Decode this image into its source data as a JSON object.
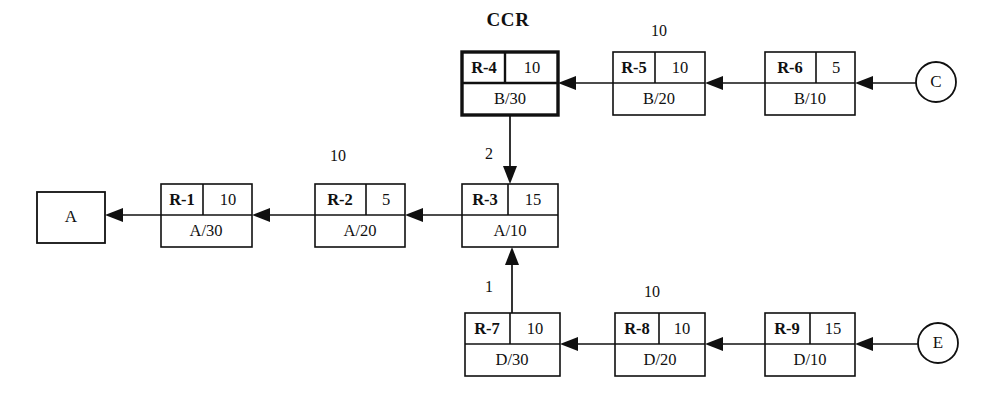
{
  "diagram": {
    "title_label": "CCR",
    "canvas": {
      "width": 986,
      "height": 399
    },
    "operations": [
      {
        "key": "r4",
        "id": "R-4",
        "qty": "10",
        "part": "B/30",
        "x": 462,
        "y": 52,
        "w": 96,
        "h": 63,
        "highlight": true
      },
      {
        "key": "r5",
        "id": "R-5",
        "qty": "10",
        "part": "B/20",
        "x": 613,
        "y": 52,
        "w": 92,
        "h": 63,
        "highlight": false
      },
      {
        "key": "r6",
        "id": "R-6",
        "qty": "5",
        "part": "B/10",
        "x": 765,
        "y": 52,
        "w": 90,
        "h": 63,
        "highlight": false
      },
      {
        "key": "r1",
        "id": "R-1",
        "qty": "10",
        "part": "A/30",
        "x": 161,
        "y": 184,
        "w": 91,
        "h": 63,
        "highlight": false
      },
      {
        "key": "r2",
        "id": "R-2",
        "qty": "5",
        "part": "A/20",
        "x": 315,
        "y": 184,
        "w": 90,
        "h": 63,
        "highlight": false
      },
      {
        "key": "r3",
        "id": "R-3",
        "qty": "15",
        "part": "A/10",
        "x": 462,
        "y": 184,
        "w": 96,
        "h": 63,
        "highlight": false
      },
      {
        "key": "r7",
        "id": "R-7",
        "qty": "10",
        "part": "D/30",
        "x": 465,
        "y": 313,
        "w": 95,
        "h": 63,
        "highlight": false
      },
      {
        "key": "r8",
        "id": "R-8",
        "qty": "10",
        "part": "D/20",
        "x": 615,
        "y": 313,
        "w": 90,
        "h": 63,
        "highlight": false
      },
      {
        "key": "r9",
        "id": "R-9",
        "qty": "15",
        "part": "D/10",
        "x": 765,
        "y": 313,
        "w": 90,
        "h": 63,
        "highlight": false
      }
    ],
    "endpoints": [
      {
        "key": "a",
        "label": "A",
        "shape": "square",
        "x": 37,
        "y": 192,
        "w": 68,
        "h": 51
      },
      {
        "key": "c",
        "label": "C",
        "shape": "circle",
        "cx": 936,
        "cy": 82,
        "r": 20
      },
      {
        "key": "e",
        "label": "E",
        "shape": "circle",
        "cx": 938,
        "cy": 343,
        "r": 20
      }
    ],
    "edge_labels": [
      {
        "key": "above-r5",
        "text": "10",
        "x": 659,
        "y": 32
      },
      {
        "key": "above-r2",
        "text": "10",
        "x": 338,
        "y": 157
      },
      {
        "key": "r4-to-r3",
        "text": "2",
        "x": 489,
        "y": 155
      },
      {
        "key": "r7-to-r3",
        "text": "1",
        "x": 489,
        "y": 288
      },
      {
        "key": "above-r8",
        "text": "10",
        "x": 652,
        "y": 293
      }
    ],
    "flows": [
      {
        "key": "c-to-r6",
        "from": "C",
        "to": "R-6",
        "direction": "left"
      },
      {
        "key": "r6-to-r5",
        "from": "R-6",
        "to": "R-5",
        "direction": "left"
      },
      {
        "key": "r5-to-r4",
        "from": "R-5",
        "to": "R-4",
        "direction": "left"
      },
      {
        "key": "r4-to-r3",
        "from": "R-4",
        "to": "R-3",
        "direction": "down"
      },
      {
        "key": "r3-to-r2",
        "from": "R-3",
        "to": "R-2",
        "direction": "left"
      },
      {
        "key": "r2-to-r1",
        "from": "R-2",
        "to": "R-1",
        "direction": "left"
      },
      {
        "key": "r1-to-a",
        "from": "R-1",
        "to": "A",
        "direction": "left"
      },
      {
        "key": "e-to-r9",
        "from": "E",
        "to": "R-9",
        "direction": "left"
      },
      {
        "key": "r9-to-r8",
        "from": "R-9",
        "to": "R-8",
        "direction": "left"
      },
      {
        "key": "r8-to-r7",
        "from": "R-8",
        "to": "R-7",
        "direction": "left"
      },
      {
        "key": "r7-to-r3",
        "from": "R-7",
        "to": "R-3",
        "direction": "up"
      }
    ]
  }
}
